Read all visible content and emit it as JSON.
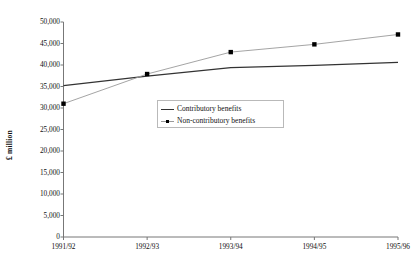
{
  "chart_data": {
    "type": "line",
    "title": "",
    "xlabel": "",
    "ylabel": "£ million",
    "categories": [
      "1991/92",
      "1992/93",
      "1993/94",
      "1994/95",
      "1995/96"
    ],
    "ylim": [
      0,
      50000
    ],
    "ytick_labels": [
      "50,000",
      "45,000",
      "40,000",
      "35,000",
      "30,000",
      "25,000",
      "20,000",
      "15,000",
      "10,000",
      "5,000",
      "0"
    ],
    "ytick_values": [
      50000,
      45000,
      40000,
      35000,
      30000,
      25000,
      20000,
      15000,
      10000,
      5000,
      0
    ],
    "ystep": 5000,
    "grid": false,
    "legend_position": "center-upper",
    "series": [
      {
        "name": "Contributory benefits",
        "marker": "none",
        "color": "#333333",
        "values": [
          35200,
          37400,
          39400,
          39900,
          40600
        ]
      },
      {
        "name": "Non-contributory benefits",
        "marker": "square",
        "color": "#8c8c8c",
        "values": [
          31000,
          37900,
          43000,
          44800,
          47100
        ]
      }
    ]
  },
  "legend": {
    "items": [
      {
        "label": "Contributory benefits",
        "marker": "line"
      },
      {
        "label": "Non-contributory benefits",
        "marker": "line-with-square"
      }
    ]
  },
  "colors": {
    "axis": "#777777",
    "contributory_line": "#333333",
    "noncontributory_line": "#9a9a9a",
    "marker": "#000000",
    "text": "#111111",
    "legend_border": "#b9b9b9"
  }
}
